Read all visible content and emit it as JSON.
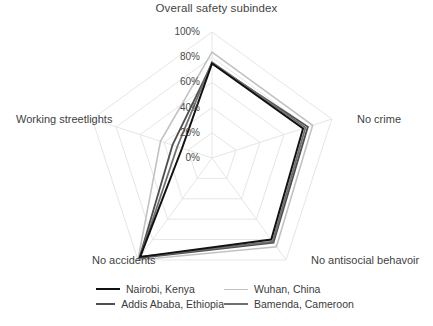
{
  "chart_data": {
    "type": "radar",
    "title": "Overall safety subindex",
    "categories": [
      "Overall safety subindex",
      "No crime",
      "No antisocial behavoir",
      "No accidents",
      "Working streetlights"
    ],
    "rlim": [
      0,
      100
    ],
    "tick_labels": [
      "0%",
      "20%",
      "40%",
      "60%",
      "80%",
      "100%"
    ],
    "tick_values": [
      0,
      20,
      40,
      60,
      80,
      100
    ],
    "tick_suffix": "%",
    "grid": true,
    "grid_shape": "polygon",
    "legend_position": "bottom",
    "legend_columns": 2,
    "series": [
      {
        "name": "Nairobi, Kenya",
        "color": "#111111",
        "width": 2.0,
        "values": [
          75,
          76,
          80,
          97,
          25
        ]
      },
      {
        "name": "Wuhan, China",
        "color": "#c2c2c2",
        "width": 1.6,
        "values": [
          84,
          84,
          87,
          100,
          43
        ]
      },
      {
        "name": "Addis Ababa, Ethiopia",
        "color": "#4f4f4f",
        "width": 1.8,
        "values": [
          75,
          80,
          83,
          98,
          33
        ]
      },
      {
        "name": "Bamenda, Cameroon",
        "color": "#6f6f6f",
        "width": 1.8,
        "values": [
          76,
          78,
          82,
          97,
          29
        ]
      }
    ]
  },
  "axis_labels": {
    "top": "Overall safety subindex",
    "right": "No crime",
    "bottom_right": "No antisocial behavoir",
    "bottom_left": "No accidents",
    "left": "Working streetlights"
  },
  "legend": {
    "entries": [
      {
        "label": "Nairobi, Kenya",
        "color": "#111111"
      },
      {
        "label": "Wuhan, China",
        "color": "#c2c2c2"
      },
      {
        "label": "Addis Ababa, Ethiopia",
        "color": "#4f4f4f"
      },
      {
        "label": "Bamenda, Cameroon",
        "color": "#6f6f6f"
      }
    ]
  },
  "style": {
    "grid_color": "#e6e6e6",
    "text_color": "#3b3b3b",
    "background": "#ffffff"
  }
}
